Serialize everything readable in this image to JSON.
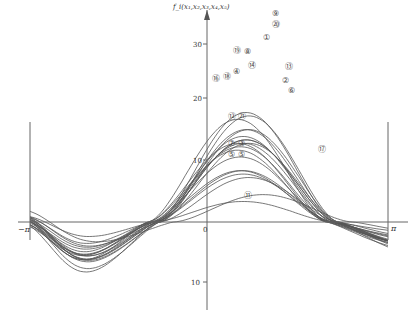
{
  "chart_data": {
    "type": "line",
    "title": "",
    "ylabel": "f_i(x1,x2,x3,x4,x5)",
    "xlabel": "",
    "x_tick_labels": [
      "-π",
      "0",
      "π"
    ],
    "y_tick_labels": [
      "30",
      "20",
      "10",
      "10"
    ],
    "xlim": [
      "-π",
      "π"
    ],
    "ylim": [
      -13,
      33
    ],
    "grid": false,
    "legend": "circled numbers annotating curves",
    "series_labels": [
      "①",
      "②",
      "③",
      "④",
      "⑤",
      "⑥",
      "⑦",
      "⑧",
      "⑨",
      "⑩",
      "⑪",
      "⑫",
      "⑬",
      "⑭",
      "⑮",
      "⑯",
      "⑰",
      "⑱",
      "⑲",
      "⑳"
    ],
    "series_count": 20,
    "series": [
      {
        "name": "①",
        "peak": 30,
        "peak_x": 0.6
      },
      {
        "name": "②",
        "peak": 22,
        "peak_x": 0.6
      },
      {
        "name": "③",
        "peak": 14,
        "peak_x": 0.6
      },
      {
        "name": "④",
        "peak": 24,
        "peak_x": 0.6
      },
      {
        "name": "⑤",
        "peak": 13,
        "peak_x": 0.6
      },
      {
        "name": "⑥",
        "peak": 21,
        "peak_x": 0.6
      },
      {
        "name": "⑦",
        "peak": 15,
        "peak_x": 0.6
      },
      {
        "name": "⑧",
        "peak": 15,
        "peak_x": 0.6
      },
      {
        "name": "⑨",
        "peak": 32,
        "peak_x": 0.6
      },
      {
        "name": "⑩",
        "peak": 27,
        "peak_x": 0.6
      },
      {
        "name": "⑪",
        "peak": 6,
        "peak_x": 0.7
      },
      {
        "name": "⑫",
        "peak": 19,
        "peak_x": 0.6
      },
      {
        "name": "⑬",
        "peak": 25,
        "peak_x": 0.6
      },
      {
        "name": "⑭",
        "peak": 24,
        "peak_x": 0.6
      },
      {
        "name": "⑮",
        "peak": 23,
        "peak_x": 0.6
      },
      {
        "name": "⑯",
        "peak": 23,
        "peak_x": 0.6
      },
      {
        "name": "⑰",
        "peak": 8,
        "peak_x": 1.0
      },
      {
        "name": "⑱",
        "peak": 23,
        "peak_x": 0.6
      },
      {
        "name": "⑲",
        "peak": 27,
        "peak_x": 0.6
      },
      {
        "name": "⑳",
        "peak": 31,
        "peak_x": 0.6
      }
    ]
  },
  "axis": {
    "y_label": "f_i(x₁,x₂,x₃,x₄,x₅)",
    "x_neg_pi": "−π",
    "x_pi": "π",
    "x_zero": "0",
    "y_30": "30",
    "y_20": "20",
    "y_10": "10",
    "y_neg10": "10"
  },
  "annotations": [
    {
      "text": "⑨",
      "x": 272,
      "y": 16
    },
    {
      "text": "⑳",
      "x": 272,
      "y": 27
    },
    {
      "text": "①",
      "x": 263,
      "y": 40
    },
    {
      "text": "⑲",
      "x": 233,
      "y": 53
    },
    {
      "text": "⑧",
      "x": 244,
      "y": 54
    },
    {
      "text": "⑬",
      "x": 285,
      "y": 69
    },
    {
      "text": "⑭",
      "x": 248,
      "y": 68
    },
    {
      "text": "④",
      "x": 233,
      "y": 74
    },
    {
      "text": "②",
      "x": 282,
      "y": 83
    },
    {
      "text": "⑥",
      "x": 288,
      "y": 93
    },
    {
      "text": "⑯",
      "x": 212,
      "y": 81
    },
    {
      "text": "⑱",
      "x": 223,
      "y": 79
    },
    {
      "text": "⑫",
      "x": 228,
      "y": 119
    },
    {
      "text": "㉑",
      "x": 238,
      "y": 119
    },
    {
      "text": "⑦",
      "x": 228,
      "y": 146
    },
    {
      "text": "③",
      "x": 238,
      "y": 146
    },
    {
      "text": "⑤",
      "x": 228,
      "y": 157
    },
    {
      "text": "⑤",
      "x": 238,
      "y": 157
    },
    {
      "text": "⑰",
      "x": 318,
      "y": 152
    },
    {
      "text": "⑪",
      "x": 244,
      "y": 198
    }
  ]
}
